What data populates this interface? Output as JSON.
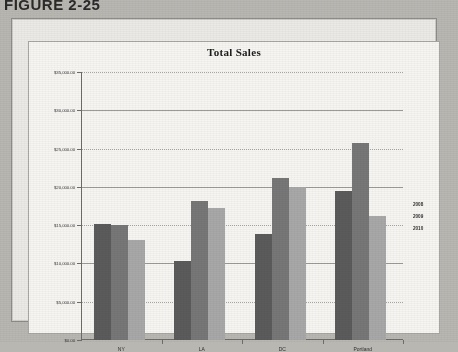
{
  "caption": "FIGURE 2-25",
  "chart_data": {
    "type": "bar",
    "title": "Total Sales",
    "xlabel": "",
    "ylabel": "",
    "categories": [
      "NY",
      "LA",
      "DC",
      "Portland"
    ],
    "series": [
      {
        "name": "2008",
        "color": "#5b5b5b",
        "values": [
          15100,
          10300,
          13800,
          19400
        ]
      },
      {
        "name": "2009",
        "color": "#777777",
        "values": [
          15050,
          18100,
          21100,
          25700
        ]
      },
      {
        "name": "2010",
        "color": "#a8a8a8",
        "values": [
          13100,
          17200,
          20000,
          16200
        ]
      }
    ],
    "ylim": [
      0,
      35000
    ],
    "ytick_values": [
      0,
      5000,
      10000,
      15000,
      20000,
      25000,
      30000,
      35000
    ],
    "ytick_labels": [
      "$0.00",
      "$5,000.00",
      "$10,000.00",
      "$15,000.00",
      "$20,000.00",
      "$25,000.00",
      "$30,000.00",
      "$35,000.00"
    ],
    "grid": true,
    "legend_position": "right",
    "legend_entries": [
      "2008",
      "2009",
      "2010"
    ]
  }
}
